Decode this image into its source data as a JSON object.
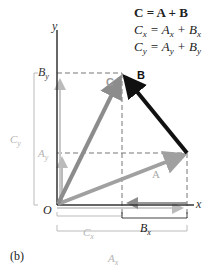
{
  "equations": {
    "line1": "C = A + B",
    "line2": "Cx = Ax + Bx",
    "line3": "Cy = Ay + By"
  },
  "labels": {
    "y_axis": "y",
    "x_axis": "x",
    "origin": "O",
    "vector_a": "A",
    "vector_b": "B",
    "vector_c": "C",
    "by": "B",
    "by_sub": "y",
    "ay": "A",
    "ay_sub": "y",
    "cy": "C",
    "cy_sub": "y",
    "cx": "C",
    "cx_sub": "x",
    "bx": "B",
    "bx_sub": "x",
    "ax": "A",
    "ax_sub": "x",
    "panel": "(b)"
  },
  "colors": {
    "vector_a": "#a0a0a0",
    "vector_b": "#111111",
    "vector_c": "#8c8c8c",
    "axes": "#333333",
    "dashed": "#777777",
    "light_label": "#b5b5b5"
  }
}
